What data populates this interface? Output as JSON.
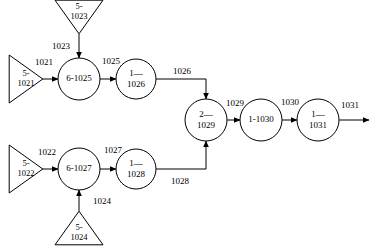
{
  "diagram": {
    "type": "flow-diagram",
    "canvas": {
      "width": 373,
      "height": 248
    },
    "colors": {
      "stroke": "#000000",
      "fill": "#ffffff",
      "text": "#000000"
    },
    "sources": [
      {
        "id": "src-1021",
        "shape": "triangle",
        "direction": "right",
        "line1": "5-",
        "line2": "1021",
        "cx": 26,
        "cy": 79,
        "size": 24
      },
      {
        "id": "src-1023",
        "shape": "triangle",
        "direction": "down",
        "line1": "5-",
        "line2": "1023",
        "cx": 79,
        "cy": 17,
        "size": 24
      },
      {
        "id": "src-1022",
        "shape": "triangle",
        "direction": "right",
        "line1": "5-",
        "line2": "1022",
        "cx": 26,
        "cy": 169,
        "size": 24
      },
      {
        "id": "src-1024",
        "shape": "triangle",
        "direction": "up",
        "line1": "5-",
        "line2": "1024",
        "cx": 79,
        "cy": 228,
        "size": 24
      }
    ],
    "nodes": [
      {
        "id": "node-6-1025",
        "shape": "circle",
        "label_mode": "single",
        "line1": "6-1025",
        "line2": "",
        "cx": 79,
        "cy": 79,
        "r": 21
      },
      {
        "id": "node-1-1026",
        "shape": "circle",
        "label_mode": "double",
        "line1": "1—",
        "line2": "1026",
        "cx": 136,
        "cy": 79,
        "r": 20
      },
      {
        "id": "node-6-1027",
        "shape": "circle",
        "label_mode": "single",
        "line1": "6-1027",
        "line2": "",
        "cx": 79,
        "cy": 169,
        "r": 21
      },
      {
        "id": "node-1-1028",
        "shape": "circle",
        "label_mode": "double",
        "line1": "1—",
        "line2": "1028",
        "cx": 136,
        "cy": 169,
        "r": 20
      },
      {
        "id": "node-2-1029",
        "shape": "circle",
        "label_mode": "double",
        "line1": "2—",
        "line2": "1029",
        "cx": 206,
        "cy": 120,
        "r": 21
      },
      {
        "id": "node-1-1030",
        "shape": "circle",
        "label_mode": "single",
        "line1": "1-1030",
        "line2": "",
        "cx": 261,
        "cy": 120,
        "r": 21
      },
      {
        "id": "node-1-1031",
        "shape": "circle",
        "label_mode": "double",
        "line1": "1—",
        "line2": "1031",
        "cx": 318,
        "cy": 120,
        "r": 21
      }
    ],
    "edges": [
      {
        "id": "edge-1021",
        "label": "1021",
        "label_x": 44,
        "label_y": 63,
        "points": "42,79 58,79",
        "arrow": true
      },
      {
        "id": "edge-1023",
        "label": "1023",
        "label_x": 61,
        "label_y": 47,
        "points": "79,34 79,58",
        "arrow": true
      },
      {
        "id": "edge-1025",
        "label": "1025",
        "label_x": 111,
        "label_y": 62,
        "points": "100,79 116,79",
        "arrow": true
      },
      {
        "id": "edge-1026",
        "label": "1026",
        "label_x": 182,
        "label_y": 72,
        "points": "156,79 206,79 206,99",
        "arrow": true
      },
      {
        "id": "edge-1022",
        "label": "1022",
        "label_x": 47,
        "label_y": 153,
        "points": "42,169 58,169",
        "arrow": true
      },
      {
        "id": "edge-1024",
        "label": "1024",
        "label_x": 102,
        "label_y": 202,
        "points": "79,211 79,190",
        "arrow": true
      },
      {
        "id": "edge-1027",
        "label": "1027",
        "label_x": 113,
        "label_y": 151,
        "points": "100,169 116,169",
        "arrow": true
      },
      {
        "id": "edge-1028",
        "label": "1028",
        "label_x": 180,
        "label_y": 182,
        "points": "156,169 206,169 206,141",
        "arrow": true
      },
      {
        "id": "edge-1029",
        "label": "1029",
        "label_x": 235,
        "label_y": 104,
        "points": "227,120 240,120",
        "arrow": true
      },
      {
        "id": "edge-1030",
        "label": "1030",
        "label_x": 290,
        "label_y": 103,
        "points": "282,120 297,120",
        "arrow": true
      },
      {
        "id": "edge-1031",
        "label": "1031",
        "label_x": 350,
        "label_y": 106,
        "points": "339,120 369,120",
        "arrow": true
      }
    ]
  }
}
